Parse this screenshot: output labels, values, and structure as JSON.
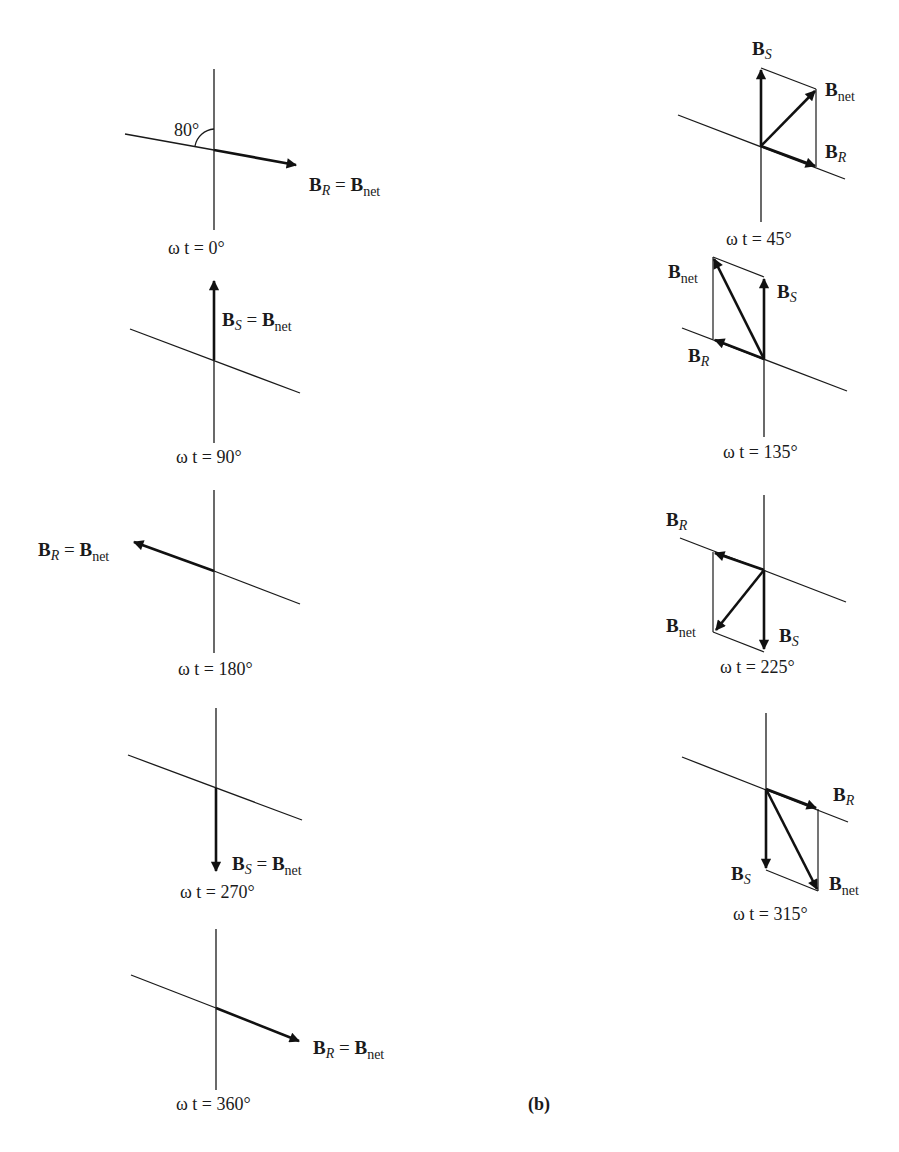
{
  "figure": {
    "label": "(b)",
    "angle_annotation": "80°",
    "vector_symbol": "B",
    "equals": " = ",
    "subscripts": {
      "stator": "S",
      "rotor": "R",
      "net": "net"
    }
  },
  "panels": [
    {
      "id": "wt0",
      "caption_prefix": "ω t = ",
      "angle": "0°",
      "label": "B_R = B_net"
    },
    {
      "id": "wt90",
      "caption_prefix": "ω t = ",
      "angle": "90°",
      "label": "B_S = B_net"
    },
    {
      "id": "wt180",
      "caption_prefix": "ω t = ",
      "angle": "180°",
      "label": "B_R = B_net"
    },
    {
      "id": "wt270",
      "caption_prefix": "ω t = ",
      "angle": "270°",
      "label": "B_S = B_net"
    },
    {
      "id": "wt360",
      "caption_prefix": "ω t = ",
      "angle": "360°",
      "label": "B_R = B_net"
    },
    {
      "id": "wt45",
      "caption_prefix": "ω t = ",
      "angle": "45°",
      "labels": [
        "B_S",
        "B_net",
        "B_R"
      ]
    },
    {
      "id": "wt135",
      "caption_prefix": "ω t = ",
      "angle": "135°",
      "labels": [
        "B_net",
        "B_S",
        "B_R"
      ]
    },
    {
      "id": "wt225",
      "caption_prefix": "ω t = ",
      "angle": "225°",
      "labels": [
        "B_R",
        "B_net",
        "B_S"
      ]
    },
    {
      "id": "wt315",
      "caption_prefix": "ω t = ",
      "angle": "315°",
      "labels": [
        "B_R",
        "B_S",
        "B_net"
      ]
    }
  ],
  "captions": {
    "wt0": "ω t = 0°",
    "wt90": "ω t = 90°",
    "wt180": "ω t = 180°",
    "wt270": "ω t = 270°",
    "wt360": "ω t = 360°",
    "wt45": "ω t = 45°",
    "wt135": "ω t = 135°",
    "wt225": "ω t = 225°",
    "wt315": "ω t = 315°"
  },
  "text": {
    "B": "B",
    "S": "S",
    "R": "R",
    "net": "net",
    "eq": " = ",
    "angle80": "80°",
    "fig_label": "(b)"
  },
  "colors": {
    "ink": "#1a1a1a",
    "background": "#ffffff"
  }
}
